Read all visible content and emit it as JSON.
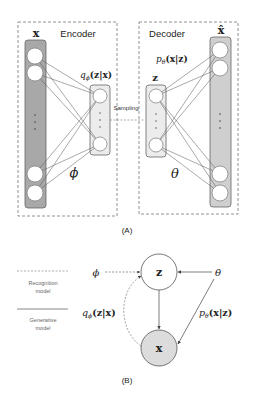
{
  "panel_a": {
    "caption": "(A)",
    "encoder": {
      "title": "Encoder",
      "input_label": "x",
      "distribution_label": "q",
      "distribution_sub": "ϕ",
      "distribution_args": "(z|x)",
      "param_label": "ϕ"
    },
    "sampling_label": "Sampling",
    "decoder": {
      "title": "Decoder",
      "latent_label": "z",
      "output_label": "x̂",
      "distribution_label": "p",
      "distribution_sub": "θ",
      "distribution_args": "(x|z)",
      "param_label": "θ"
    },
    "colors": {
      "input_bar": "#a8a8a8",
      "output_bar": "#cfcfcf",
      "latent_box": "#ececec",
      "node": "#ffffff",
      "edge": "#555555",
      "dashed_border": "#777777"
    }
  },
  "panel_b": {
    "caption": "(B)",
    "legend": {
      "dashed_label_line1": "Recognition",
      "dashed_label_line2": "model",
      "solid_label_line1": "Generative",
      "solid_label_line2": "model"
    },
    "nodes": {
      "latent": "z",
      "observed": "x"
    },
    "params": {
      "phi": "ϕ",
      "theta": "θ"
    },
    "recognition_label": {
      "fn": "q",
      "sub": "ϕ",
      "args": "(z|x)"
    },
    "generative_label": {
      "fn": "p",
      "sub": "θ",
      "args": "(x|z)"
    },
    "colors": {
      "observed_fill": "#dcdcdc",
      "latent_fill": "#ffffff",
      "edge": "#444444"
    }
  }
}
